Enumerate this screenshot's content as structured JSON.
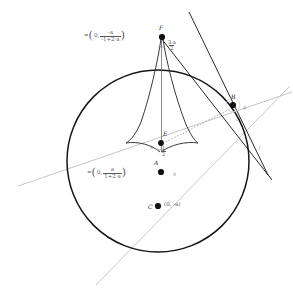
{
  "figure": {
    "colors": {
      "circle_stroke": "#151515",
      "cusp_stroke": "#3a3a3a",
      "tangent_stroke": "#101010",
      "gray_line": "#bdbdbd",
      "dotted_line": "#9a9a9a",
      "point_fill": "#111111",
      "label_text": "#333333",
      "formula_text": "#5a5a5a",
      "line_label": "#8c8c8c",
      "background": "#ffffff"
    },
    "circle": {
      "cx": 158,
      "cy": 161,
      "r": 91
    },
    "points": [
      {
        "id": "F",
        "label": "F",
        "x": 162,
        "y": 37
      },
      {
        "id": "E",
        "label": "E",
        "x": 161,
        "y": 143
      },
      {
        "id": "A",
        "label": "A",
        "x": 161,
        "y": 172
      },
      {
        "id": "C",
        "label": "C",
        "x": 158,
        "y": 206
      },
      {
        "id": "B",
        "label": "B",
        "x": 233,
        "y": 105
      }
    ],
    "formulas": {
      "F_value": {
        "eq": "=",
        "open": "(",
        "first": "0,",
        "num": "-a",
        "den": "-1+2·a",
        "close": ")"
      },
      "A_value": {
        "eq": "=",
        "open": "(",
        "first": "0,",
        "num": "a",
        "den": "1+2·a",
        "close": ")"
      },
      "C_value": "(0, -a)",
      "F_segment": {
        "num": "3·a",
        "den": "2"
      },
      "E_segment": {
        "num": "1",
        "den": "2"
      }
    },
    "line_labels": [
      {
        "id": "g",
        "label": "g",
        "x": 243,
        "y": 108
      },
      {
        "id": "i",
        "label": "i",
        "x": 236,
        "y": 120
      },
      {
        "id": "j",
        "label": "j",
        "x": 259,
        "y": 148
      },
      {
        "id": "h",
        "label": "h",
        "x": 173,
        "y": 175
      },
      {
        "id": "k",
        "label": "k",
        "x": 150,
        "y": 148
      }
    ]
  }
}
